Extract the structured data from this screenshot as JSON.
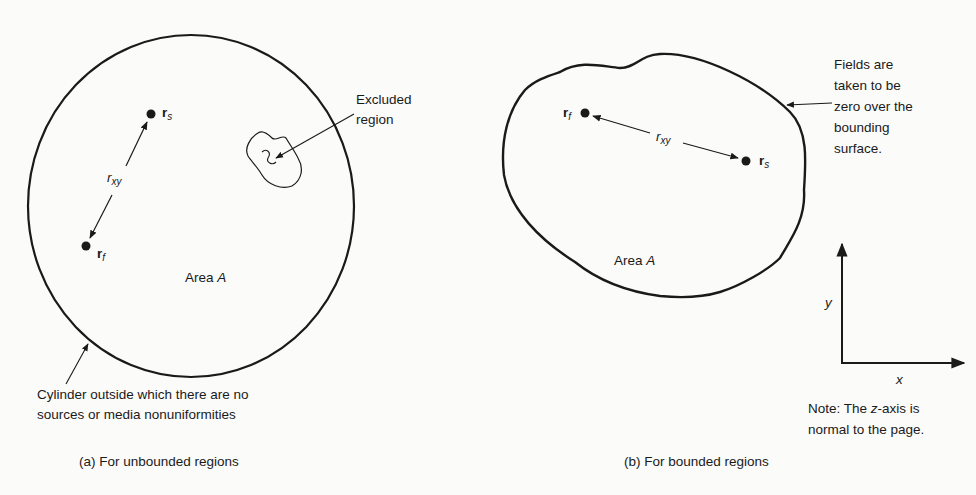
{
  "panel_a": {
    "area_label": "Area",
    "area_symbol": "A",
    "point_s": {
      "base": "r",
      "sub": "s"
    },
    "point_f": {
      "base": "r",
      "sub": "f"
    },
    "distance": {
      "base": "r",
      "sub": "xy"
    },
    "excluded_line1": "Excluded",
    "excluded_line2": "region",
    "cylinder_line1": "Cylinder outside which there are no",
    "cylinder_line2": "sources or media nonuniformities",
    "caption": "(a)  For unbounded regions"
  },
  "panel_b": {
    "area_label": "Area",
    "area_symbol": "A",
    "point_f": {
      "base": "r",
      "sub": "f"
    },
    "point_s": {
      "base": "r",
      "sub": "s"
    },
    "distance": {
      "base": "r",
      "sub": "xy"
    },
    "fields_lines": [
      "Fields are",
      "taken to be",
      "zero over the",
      "bounding",
      "surface."
    ],
    "axis_y": "y",
    "axis_x": "x",
    "note_line1_a": "Note:  The ",
    "note_line1_z": "z",
    "note_line1_b": "-axis is",
    "note_line2": "normal to the page.",
    "caption": "(b)  For bounded regions"
  }
}
